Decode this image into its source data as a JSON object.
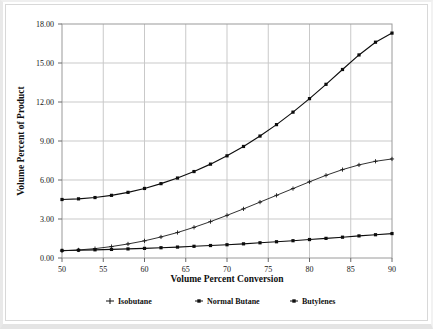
{
  "chart_data": {
    "type": "line",
    "title": "",
    "xlabel": "Volume Percent Conversion",
    "ylabel": "Volume Percent of Product",
    "xlim": [
      50,
      90
    ],
    "ylim": [
      0,
      18
    ],
    "xticks": [
      50,
      55,
      60,
      65,
      70,
      75,
      80,
      85,
      90
    ],
    "xtick_labels": [
      "50",
      "55",
      "60",
      "65",
      "70",
      "75",
      "80",
      "85",
      "90"
    ],
    "yticks": [
      0,
      3,
      6,
      9,
      12,
      15,
      18
    ],
    "ytick_labels": [
      "0.00",
      "3.00",
      "6.00",
      "9.00",
      "12.00",
      "15.00",
      "18.00"
    ],
    "grid": true,
    "legend_position": "bottom",
    "x": [
      50,
      52,
      54,
      56,
      58,
      60,
      62,
      64,
      66,
      68,
      70,
      72,
      74,
      76,
      78,
      80,
      82,
      84,
      86,
      88,
      90
    ],
    "series": [
      {
        "name": "Isobutane",
        "color": "#1a1a1a",
        "marker": "plus",
        "values": [
          0.55,
          0.62,
          0.72,
          0.88,
          1.08,
          1.32,
          1.62,
          1.96,
          2.36,
          2.8,
          3.28,
          3.78,
          4.3,
          4.82,
          5.34,
          5.86,
          6.36,
          6.8,
          7.16,
          7.44,
          7.62
        ]
      },
      {
        "name": "Normal Butane",
        "color": "#0d0d0d",
        "marker": "square",
        "values": [
          4.5,
          4.55,
          4.65,
          4.82,
          5.05,
          5.35,
          5.72,
          6.15,
          6.65,
          7.22,
          7.86,
          8.58,
          9.38,
          10.26,
          11.22,
          12.26,
          13.36,
          14.5,
          15.62,
          16.6,
          17.3
        ]
      },
      {
        "name": "Butylenes",
        "color": "#0d0d0d",
        "marker": "square",
        "values": [
          0.58,
          0.6,
          0.63,
          0.66,
          0.7,
          0.74,
          0.79,
          0.84,
          0.9,
          0.96,
          1.02,
          1.09,
          1.17,
          1.25,
          1.33,
          1.42,
          1.51,
          1.6,
          1.7,
          1.79,
          1.88
        ]
      }
    ]
  },
  "legend": {
    "items": [
      {
        "label": "Isobutane",
        "marker": "plus"
      },
      {
        "label": "Normal Butane",
        "marker": "plus-square"
      },
      {
        "label": "Butylenes",
        "marker": "plus-square"
      }
    ]
  },
  "axes": {
    "x_title": "Volume Percent Conversion",
    "y_title": "Volume Percent of Product"
  }
}
